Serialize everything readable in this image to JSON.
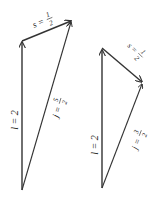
{
  "diagrams": [
    {
      "name": "left",
      "l_label": "l = 2",
      "s_label": "s = ",
      "s_num": "1",
      "s_den": "2",
      "j_label": "j = ",
      "j_num": "5",
      "j_den": "2"
    },
    {
      "name": "right",
      "l_label": "l = 2",
      "s_label": "s = ",
      "s_num": "1",
      "s_den": "2",
      "j_label": "j = ",
      "j_num": "3",
      "j_den": "2"
    }
  ],
  "colors": {
    "stroke": "#333333"
  }
}
